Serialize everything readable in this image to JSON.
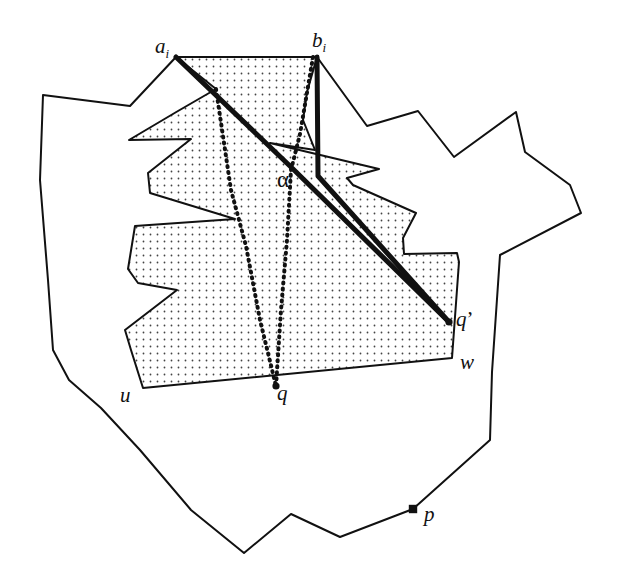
{
  "figure": {
    "type": "geometric-diagram",
    "background_color": "#ffffff",
    "ink_color": "#111111",
    "stipple_color": "#555555"
  },
  "labels": [
    {
      "id": "a_i",
      "text": "a",
      "subscript": "i",
      "prime": "",
      "x": 155,
      "y": 36,
      "anchor_x": 176,
      "anchor_y": 57
    },
    {
      "id": "b_i",
      "text": "b",
      "subscript": "i",
      "prime": "",
      "x": 312,
      "y": 30,
      "anchor_x": 317,
      "anchor_y": 57
    },
    {
      "id": "alpha",
      "text": "α",
      "subscript": "",
      "prime": "",
      "x": 277,
      "y": 168,
      "anchor_x": 291,
      "anchor_y": 167
    },
    {
      "id": "q_prime",
      "text": "q",
      "subscript": "",
      "prime": "’",
      "x": 456,
      "y": 309,
      "anchor_x": 449,
      "anchor_y": 322
    },
    {
      "id": "w",
      "text": "w",
      "subscript": "",
      "prime": "",
      "x": 460,
      "y": 352,
      "anchor_x": 452,
      "anchor_y": 358
    },
    {
      "id": "u",
      "text": "u",
      "subscript": "",
      "prime": "",
      "x": 120,
      "y": 385,
      "anchor_x": 143,
      "anchor_y": 388
    },
    {
      "id": "q",
      "text": "q",
      "subscript": "",
      "prime": "",
      "x": 277,
      "y": 383,
      "anchor_x": 276,
      "anchor_y": 386
    },
    {
      "id": "p",
      "text": "p",
      "subscript": "",
      "prime": "",
      "x": 424,
      "y": 504,
      "anchor_x": 413,
      "anchor_y": 509
    }
  ],
  "geometry": {
    "outer_polygon": {
      "name": "outer-simple-polygon",
      "stroke": "#111111",
      "stroke_width": 2,
      "fill": "none",
      "points": "176,57 130,106 43,95 40,180 48,280 53,350 69,380 101,408 140,450 191,510 244,553 291,514 340,537 413,509 490,440 492,372 500,255 581,213 570,185 525,152 516,112 454,157 418,111 367,126 317,57"
    },
    "stippled_polygon": {
      "name": "shaded-visibility-region",
      "stroke": "#111111",
      "stroke_width": 2,
      "fill": "stipple",
      "points": "176,57 317,57 307,92 303,120 315,150 270,143 379,169 347,178 353,185 416,213 403,238 404,254 457,253 459,262 452,358 143,388 131,350 125,330 177,290 138,283 128,269 135,226 235,219 150,193 148,173 191,139 129,140 178,111 216,89"
    },
    "stipple": {
      "dot_spacing": 7,
      "dot_radius": 0.85,
      "color": "#444444"
    },
    "thick_paths": [
      {
        "name": "shortest-path-from-a-i",
        "stroke": "#111111",
        "stroke_width": 5,
        "points": "176,57 291,167 449,322"
      },
      {
        "name": "shortest-path-from-b-i",
        "stroke": "#111111",
        "stroke_width": 5,
        "points": "317,57 318,176 449,322"
      }
    ],
    "dotted_paths": [
      {
        "name": "dotted-path-left-to-q",
        "stroke": "#111111",
        "stroke_width": 4,
        "dash": "1 5",
        "points": "216,89 231,190 246,246 260,320 276,386"
      },
      {
        "name": "dotted-path-right-through-alpha-to-q",
        "stroke": "#111111",
        "stroke_width": 4,
        "dash": "1 5",
        "points": "313,57 300,134 291,170 287,240 281,310 276,386"
      }
    ],
    "marked_points": [
      {
        "name": "point-q",
        "x": 276,
        "y": 386,
        "r": 3.6,
        "shape": "disc"
      },
      {
        "name": "point-q-prime",
        "x": 449,
        "y": 322,
        "r": 3.6,
        "shape": "disc"
      },
      {
        "name": "point-p",
        "x": 413,
        "y": 509,
        "r": 4.2,
        "shape": "square"
      }
    ]
  }
}
